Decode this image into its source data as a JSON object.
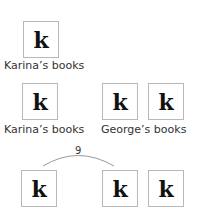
{
  "icon_glyph": "k",
  "row1": {
    "boxes": [
      {
        "glyph": "k"
      }
    ],
    "label": "Karina’s books"
  },
  "row2": {
    "left_label": "Karina’s books",
    "right_label": "George’s books",
    "boxes": [
      {
        "glyph": "k"
      },
      {
        "glyph": "k"
      },
      {
        "glyph": "k"
      }
    ]
  },
  "row3": {
    "boxes": [
      {
        "glyph": "k"
      },
      {
        "glyph": "k"
      },
      {
        "glyph": "k"
      }
    ],
    "arc_label": "9"
  },
  "colors": {
    "border": "#b8b8b8",
    "glyph": "#111111",
    "arc": "#999999",
    "text": "#333333"
  }
}
